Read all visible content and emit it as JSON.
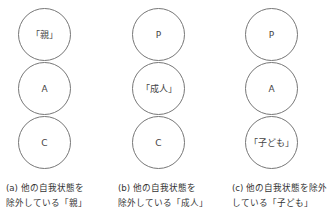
{
  "figure": {
    "panels": [
      {
        "id": "a",
        "circles": [
          "「親」",
          "A",
          "C"
        ],
        "caption_line1": "(a) 他の自我状態を",
        "caption_line2": "除外している「親」"
      },
      {
        "id": "b",
        "circles": [
          "P",
          "「成人」",
          "C"
        ],
        "caption_line1": "(b) 他の自我状態を",
        "caption_line2": "除外している「成人」"
      },
      {
        "id": "c",
        "circles": [
          "P",
          "A",
          "「子ども」"
        ],
        "caption_line1": "(c) 他の自我状態を除外",
        "caption_line2": "している「子ども」"
      }
    ]
  }
}
